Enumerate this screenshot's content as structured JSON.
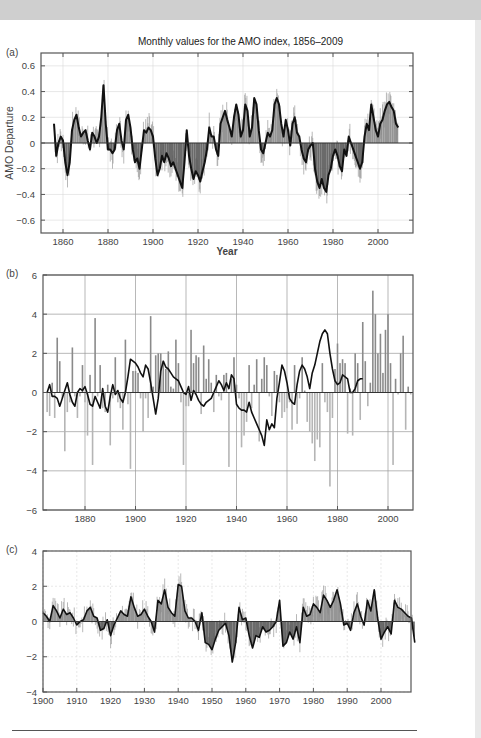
{
  "page": {
    "title": "Monthly values for the AMO index, 1856–2009",
    "panel_labels": [
      "(a)",
      "(b)",
      "(c)"
    ],
    "colors": {
      "positive_fill": "#8a8a8a",
      "negative_fill": "#5a5a5a",
      "smooth_line": "#111111",
      "bars_pos": "#8a8a8a",
      "bars_neg": "#b5b5b5",
      "grid": "#d8d8d8",
      "frame": "#555555"
    }
  },
  "chart_data": [
    {
      "panel": "(a)",
      "type": "area",
      "title": "Monthly values for the AMO index, 1856–2009",
      "xlabel": "Year",
      "ylabel": "AMO Departure",
      "xlim": [
        1852,
        2015
      ],
      "ylim": [
        -0.7,
        0.7
      ],
      "xticks": [
        1860,
        1880,
        1900,
        1920,
        1940,
        1960,
        1980,
        2000
      ],
      "yticks": [
        -0.6,
        -0.4,
        -0.2,
        0,
        0.2,
        0.4,
        0.6
      ],
      "ytick_labels": [
        "−0.6",
        "−0.4",
        "−0.2",
        "0",
        "0.2",
        "0.4",
        "0.6"
      ],
      "grid": true,
      "smoothed": {
        "x": [
          1856,
          1857,
          1858,
          1859,
          1860,
          1861,
          1862,
          1863,
          1864,
          1865,
          1866,
          1867,
          1868,
          1869,
          1870,
          1871,
          1872,
          1873,
          1874,
          1875,
          1876,
          1877,
          1878,
          1879,
          1880,
          1881,
          1882,
          1883,
          1884,
          1885,
          1886,
          1887,
          1888,
          1889,
          1890,
          1891,
          1892,
          1893,
          1894,
          1895,
          1896,
          1897,
          1898,
          1899,
          1900,
          1901,
          1902,
          1903,
          1904,
          1905,
          1906,
          1907,
          1908,
          1909,
          1910,
          1911,
          1912,
          1913,
          1914,
          1915,
          1916,
          1917,
          1918,
          1919,
          1920,
          1921,
          1922,
          1923,
          1924,
          1925,
          1926,
          1927,
          1928,
          1929,
          1930,
          1931,
          1932,
          1933,
          1934,
          1935,
          1936,
          1937,
          1938,
          1939,
          1940,
          1941,
          1942,
          1943,
          1944,
          1945,
          1946,
          1947,
          1948,
          1949,
          1950,
          1951,
          1952,
          1953,
          1954,
          1955,
          1956,
          1957,
          1958,
          1959,
          1960,
          1961,
          1962,
          1963,
          1964,
          1965,
          1966,
          1967,
          1968,
          1969,
          1970,
          1971,
          1972,
          1973,
          1974,
          1975,
          1976,
          1977,
          1978,
          1979,
          1980,
          1981,
          1982,
          1983,
          1984,
          1985,
          1986,
          1987,
          1988,
          1989,
          1990,
          1991,
          1992,
          1993,
          1994,
          1995,
          1996,
          1997,
          1998,
          1999,
          2000,
          2001,
          2002,
          2003,
          2004,
          2005,
          2006,
          2007,
          2008,
          2009
        ],
        "y": [
          0.15,
          -0.1,
          0.0,
          0.05,
          0.02,
          -0.15,
          -0.25,
          -0.15,
          0.1,
          0.18,
          0.22,
          0.12,
          0.05,
          0.08,
          0.1,
          0.02,
          -0.05,
          0.08,
          0.05,
          0.0,
          0.05,
          0.2,
          0.45,
          0.15,
          -0.05,
          -0.05,
          -0.08,
          -0.05,
          0.1,
          0.15,
          0.02,
          -0.05,
          0.18,
          0.22,
          0.12,
          -0.05,
          -0.15,
          -0.12,
          -0.2,
          -0.05,
          0.1,
          0.08,
          0.12,
          0.1,
          0.05,
          -0.12,
          -0.25,
          -0.2,
          -0.1,
          -0.15,
          -0.08,
          -0.12,
          -0.18,
          -0.15,
          -0.2,
          -0.25,
          -0.3,
          -0.35,
          -0.15,
          0.1,
          -0.1,
          -0.2,
          -0.28,
          -0.22,
          -0.25,
          -0.3,
          -0.22,
          -0.15,
          -0.05,
          0.12,
          0.05,
          0.05,
          -0.05,
          -0.1,
          0.15,
          0.2,
          0.25,
          0.18,
          0.12,
          0.05,
          0.2,
          0.3,
          0.22,
          0.05,
          0.1,
          0.3,
          0.25,
          0.05,
          0.12,
          0.35,
          0.3,
          0.1,
          -0.05,
          -0.08,
          0.0,
          0.08,
          0.05,
          0.1,
          0.3,
          0.35,
          0.3,
          0.15,
          0.05,
          0.18,
          0.1,
          -0.02,
          0.15,
          0.2,
          0.08,
          0.05,
          -0.05,
          -0.12,
          -0.15,
          -0.05,
          -0.02,
          0.0,
          -0.2,
          -0.3,
          -0.35,
          -0.28,
          -0.35,
          -0.38,
          -0.25,
          -0.2,
          -0.1,
          -0.05,
          -0.1,
          -0.18,
          -0.22,
          -0.05,
          -0.1,
          0.05,
          0.0,
          -0.05,
          -0.1,
          -0.15,
          -0.2,
          -0.15,
          0.05,
          0.15,
          0.1,
          0.3,
          0.2,
          0.1,
          0.05,
          0.15,
          0.18,
          0.25,
          0.3,
          0.32,
          0.28,
          0.25,
          0.15,
          0.12
        ]
      }
    },
    {
      "panel": "(b)",
      "type": "bar",
      "xlim": [
        1863,
        2011
      ],
      "ylim": [
        -6,
        6
      ],
      "xticks": [
        1880,
        1900,
        1920,
        1940,
        1960,
        1980,
        2000
      ],
      "yticks": [
        -6,
        -4,
        -2,
        0,
        2,
        4,
        6
      ],
      "ytick_labels": [
        "−6",
        "−4",
        "−2",
        "0",
        "2",
        "4",
        "6"
      ],
      "grid": true,
      "bars": {
        "x": [
          1865,
          1866,
          1867,
          1868,
          1869,
          1870,
          1871,
          1872,
          1873,
          1874,
          1875,
          1876,
          1877,
          1878,
          1879,
          1880,
          1881,
          1882,
          1883,
          1884,
          1885,
          1886,
          1887,
          1888,
          1889,
          1890,
          1891,
          1892,
          1893,
          1894,
          1895,
          1896,
          1897,
          1898,
          1899,
          1900,
          1901,
          1902,
          1903,
          1904,
          1905,
          1906,
          1907,
          1908,
          1909,
          1910,
          1911,
          1912,
          1913,
          1914,
          1915,
          1916,
          1917,
          1918,
          1919,
          1920,
          1921,
          1922,
          1923,
          1924,
          1925,
          1926,
          1927,
          1928,
          1929,
          1930,
          1931,
          1932,
          1933,
          1934,
          1935,
          1936,
          1937,
          1938,
          1939,
          1940,
          1941,
          1942,
          1943,
          1944,
          1945,
          1946,
          1947,
          1948,
          1949,
          1950,
          1951,
          1952,
          1953,
          1954,
          1955,
          1956,
          1957,
          1958,
          1959,
          1960,
          1961,
          1962,
          1963,
          1964,
          1965,
          1966,
          1967,
          1968,
          1969,
          1970,
          1971,
          1972,
          1973,
          1974,
          1975,
          1976,
          1977,
          1978,
          1979,
          1980,
          1981,
          1982,
          1983,
          1984,
          1985,
          1986,
          1987,
          1988,
          1989,
          1990,
          1991,
          1992,
          1993,
          1994,
          1995,
          1996,
          1997,
          1998,
          1999,
          2000,
          2001,
          2002,
          2003,
          2004,
          2005,
          2006,
          2007,
          2008,
          2009
        ],
        "values": [
          -1.0,
          -1.2,
          0.5,
          -1.3,
          2.8,
          1.6,
          -0.3,
          -3.0,
          -1.0,
          -0.5,
          2.3,
          -0.2,
          -1.3,
          -0.2,
          1.4,
          -0.5,
          -2.2,
          0.9,
          -3.7,
          3.8,
          -0.2,
          1.4,
          -0.8,
          -1.0,
          0.4,
          -2.7,
          -0.3,
          1.8,
          -0.5,
          -0.8,
          -1.9,
          2.7,
          -0.6,
          -3.9,
          1.1,
          1.1,
          1.0,
          -0.3,
          -2.0,
          -0.3,
          -1.3,
          3.9,
          0.3,
          1.9,
          2.0,
          2.0,
          1.6,
          1.2,
          2.1,
          0.3,
          0.2,
          2.7,
          1.5,
          -0.5,
          -3.7,
          -0.7,
          -0.7,
          3.2,
          1.5,
          1.9,
          1.8,
          -1.1,
          2.4,
          0.7,
          1.7,
          0.5,
          -1.0,
          0.9,
          -0.2,
          -0.4,
          0.9,
          1.0,
          -3.8,
          0.7,
          1.8,
          0.4,
          -0.3,
          -2.8,
          -2.2,
          -1.5,
          1.4,
          -0.8,
          0.4,
          1.7,
          -2.5,
          0.7,
          1.8,
          1.4,
          -0.2,
          -1.2,
          1.1,
          0.9,
          -0.5,
          -1.3,
          -1.0,
          -0.8,
          -0.5,
          -1.9,
          1.4,
          -1.6,
          -0.3,
          1.8,
          0.1,
          -1.5,
          -2.0,
          -2.6,
          -3.5,
          -2.4,
          -2.8,
          1.5,
          -0.5,
          -1.0,
          -4.8,
          -1.3,
          1.2,
          2.5,
          1.5,
          1.7,
          1.5,
          -2.1,
          0.2,
          -2.2,
          2.0,
          1.5,
          -1.4,
          3.6,
          1.6,
          -0.7,
          0.5,
          5.2,
          4.0,
          2.0,
          3.0,
          1.0,
          3.2,
          4.0,
          1.5,
          -3.7,
          0.7,
          -0.1,
          2.0,
          2.9,
          -1.9,
          0.3,
          -0.1,
          -1.1,
          2.8,
          2.0,
          -0.4
        ]
      },
      "smoothed": {
        "x": [
          1865,
          1866,
          1867,
          1868,
          1869,
          1870,
          1871,
          1872,
          1873,
          1874,
          1875,
          1876,
          1877,
          1878,
          1879,
          1880,
          1881,
          1882,
          1883,
          1884,
          1885,
          1886,
          1887,
          1888,
          1889,
          1890,
          1891,
          1892,
          1893,
          1894,
          1895,
          1896,
          1897,
          1898,
          1899,
          1900,
          1901,
          1902,
          1903,
          1904,
          1905,
          1906,
          1907,
          1908,
          1909,
          1910,
          1911,
          1912,
          1913,
          1914,
          1915,
          1916,
          1917,
          1918,
          1919,
          1920,
          1921,
          1922,
          1923,
          1924,
          1925,
          1926,
          1927,
          1928,
          1929,
          1930,
          1931,
          1932,
          1933,
          1934,
          1935,
          1936,
          1937,
          1938,
          1939,
          1940,
          1941,
          1942,
          1943,
          1944,
          1945,
          1946,
          1947,
          1948,
          1949,
          1950,
          1951,
          1952,
          1953,
          1954,
          1955,
          1956,
          1957,
          1958,
          1959,
          1960,
          1961,
          1962,
          1963,
          1964,
          1965,
          1966,
          1967,
          1968,
          1969,
          1970,
          1971,
          1972,
          1973,
          1974,
          1975,
          1976,
          1977,
          1978,
          1979,
          1980,
          1981,
          1982,
          1983,
          1984,
          1985,
          1986,
          1987,
          1988,
          1989,
          1990,
          1991,
          1992,
          1993,
          1994,
          1995,
          1996,
          1997,
          1998,
          1999,
          2000,
          2001,
          2002,
          2003,
          2004,
          2005,
          2006,
          2007,
          2008,
          2009
        ],
        "y": [
          0.0,
          0.4,
          -0.2,
          -0.2,
          -0.3,
          -0.7,
          -0.3,
          0.1,
          0.5,
          -0.1,
          -0.5,
          -0.7,
          0.0,
          0.2,
          0.1,
          0.3,
          -0.1,
          -0.6,
          -0.7,
          -0.2,
          -0.5,
          -0.8,
          0.2,
          -0.7,
          -1.0,
          -0.2,
          0.4,
          -0.1,
          0.1,
          -0.3,
          -0.5,
          0.0,
          0.8,
          1.7,
          1.6,
          1.5,
          1.3,
          1.0,
          0.8,
          1.4,
          1.2,
          0.5,
          -0.3,
          -1.1,
          -0.3,
          1.1,
          1.6,
          1.3,
          1.2,
          1.0,
          0.8,
          0.7,
          0.6,
          0.3,
          0.0,
          -0.1,
          0.3,
          -0.4,
          0.1,
          -0.1,
          -0.4,
          -0.6,
          -0.7,
          -0.5,
          -0.4,
          -0.3,
          0.0,
          0.3,
          0.6,
          0.4,
          0.1,
          0.5,
          0.2,
          0.9,
          0.7,
          -0.6,
          -0.8,
          -0.9,
          -0.9,
          -1.0,
          -0.5,
          -1.0,
          -1.3,
          -1.6,
          -1.9,
          -2.2,
          -2.7,
          -1.4,
          -1.9,
          -1.6,
          -1.8,
          -0.3,
          0.5,
          1.4,
          1.1,
          0.5,
          -0.3,
          -0.5,
          -0.6,
          0.4,
          1.1,
          1.4,
          1.2,
          0.8,
          0.2,
          1.0,
          1.4,
          2.0,
          2.6,
          3.0,
          3.2,
          3.0,
          2.0,
          1.2,
          0.6,
          0.4,
          0.5,
          0.9,
          0.8,
          0.7,
          0.0,
          0.0,
          0.2,
          0.6,
          0.7,
          0.7
        ]
      }
    },
    {
      "panel": "(c)",
      "type": "area",
      "xlim": [
        1900,
        2011
      ],
      "ylim": [
        -4,
        4
      ],
      "xticks": [
        1900,
        1910,
        1920,
        1930,
        1940,
        1950,
        1960,
        1970,
        1980,
        1990,
        2000
      ],
      "yticks": [
        -4,
        -2,
        0,
        2,
        4
      ],
      "ytick_labels": [
        "−4",
        "−2",
        "0",
        "2",
        "4"
      ],
      "grid": true,
      "smoothed": {
        "x": [
          1900,
          1901,
          1902,
          1903,
          1904,
          1905,
          1906,
          1907,
          1908,
          1909,
          1910,
          1911,
          1912,
          1913,
          1914,
          1915,
          1916,
          1917,
          1918,
          1919,
          1920,
          1921,
          1922,
          1923,
          1924,
          1925,
          1926,
          1927,
          1928,
          1929,
          1930,
          1931,
          1932,
          1933,
          1934,
          1935,
          1936,
          1937,
          1938,
          1939,
          1940,
          1941,
          1942,
          1943,
          1944,
          1945,
          1946,
          1947,
          1948,
          1949,
          1950,
          1951,
          1952,
          1953,
          1954,
          1955,
          1956,
          1957,
          1958,
          1959,
          1960,
          1961,
          1962,
          1963,
          1964,
          1965,
          1966,
          1967,
          1968,
          1969,
          1970,
          1971,
          1972,
          1973,
          1974,
          1975,
          1976,
          1977,
          1978,
          1979,
          1980,
          1981,
          1982,
          1983,
          1984,
          1985,
          1986,
          1987,
          1988,
          1989,
          1990,
          1991,
          1992,
          1993,
          1994,
          1995,
          1996,
          1997,
          1998,
          1999,
          2000,
          2001,
          2002,
          2003,
          2004,
          2005,
          2006,
          2007,
          2008,
          2009,
          2010
        ],
        "y": [
          0.5,
          0.3,
          0.0,
          0.9,
          0.6,
          0.2,
          0.7,
          0.4,
          0.5,
          0.2,
          -0.2,
          0.0,
          0.1,
          0.6,
          0.8,
          0.3,
          0.2,
          -0.5,
          -0.4,
          0.1,
          -0.8,
          -0.2,
          0.2,
          0.6,
          0.4,
          0.3,
          1.4,
          0.8,
          0.3,
          0.4,
          0.7,
          0.3,
          0.0,
          -0.6,
          1.2,
          1.0,
          1.8,
          0.8,
          0.5,
          0.3,
          2.1,
          2.0,
          0.6,
          0.2,
          0.2,
          0.0,
          -0.5,
          0.5,
          -1.2,
          -1.3,
          -1.6,
          -1.0,
          -0.5,
          -0.3,
          -0.1,
          -0.8,
          -2.3,
          -1.2,
          0.8,
          0.1,
          0.2,
          -0.8,
          -1.5,
          -0.8,
          -0.9,
          -0.3,
          -0.6,
          -0.5,
          -0.3,
          0.0,
          1.2,
          -1.4,
          -1.2,
          -0.6,
          -1.0,
          -0.3,
          -1.2,
          0.8,
          0.3,
          0.4,
          1.0,
          0.8,
          0.5,
          1.5,
          1.2,
          0.8,
          1.2,
          1.8,
          1.0,
          -0.2,
          -0.1,
          -0.5,
          0.5,
          1.0,
          0.3,
          -0.2,
          1.2,
          0.6,
          1.8,
          0.2,
          -1.0,
          -0.6,
          -0.3,
          -0.7,
          1.2,
          0.8,
          0.7,
          0.5,
          0.3,
          0.2,
          -1.2
        ]
      }
    }
  ]
}
